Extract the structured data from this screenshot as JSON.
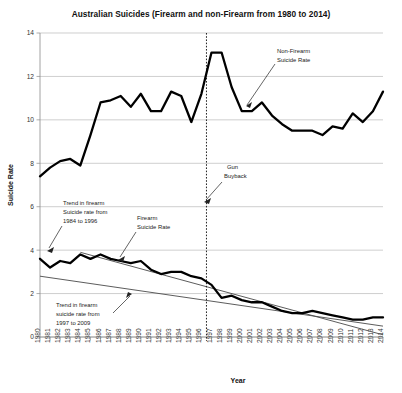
{
  "chart_data": {
    "type": "line",
    "title": "Australian Suicides (Firearm and non-Firearm from 1980 to 2014)",
    "xlabel": "Year",
    "ylabel": "Suicide Rate",
    "xlim": [
      1980,
      2014
    ],
    "ylim": [
      0,
      14
    ],
    "yticks": [
      0,
      2,
      4,
      6,
      8,
      10,
      12,
      14
    ],
    "grid": "horizontal",
    "legend_position": "inline-annotations",
    "x": [
      1980,
      1981,
      1982,
      1983,
      1984,
      1985,
      1986,
      1987,
      1988,
      1989,
      1990,
      1991,
      1992,
      1993,
      1994,
      1995,
      1996,
      1997,
      1998,
      1999,
      2000,
      2001,
      2002,
      2003,
      2004,
      2005,
      2006,
      2007,
      2008,
      2009,
      2010,
      2011,
      2012,
      2013,
      2014
    ],
    "categories": [
      "1980",
      "1981",
      "1982",
      "1983",
      "1984",
      "1985",
      "1986",
      "1987",
      "1988",
      "1989",
      "1990",
      "1991",
      "1992",
      "1993",
      "1994",
      "1995",
      "1996",
      "1997",
      "1998",
      "1999",
      "2000",
      "2001",
      "2002",
      "2003",
      "2004",
      "2005",
      "2006",
      "2007",
      "2008",
      "2009",
      "2010",
      "2011",
      "2012",
      "2013",
      "2014"
    ],
    "series": [
      {
        "name": "Non-Firearm Suicide Rate",
        "values": [
          7.4,
          7.8,
          8.1,
          8.2,
          7.9,
          9.3,
          10.8,
          10.9,
          11.1,
          10.6,
          11.2,
          10.4,
          10.4,
          11.3,
          11.1,
          9.9,
          11.2,
          13.1,
          13.1,
          11.5,
          10.4,
          10.4,
          10.8,
          10.2,
          9.8,
          9.5,
          9.5,
          9.5,
          9.3,
          9.7,
          9.6,
          10.3,
          9.9,
          10.4,
          11.3
        ]
      },
      {
        "name": "Firearm Suicide Rate",
        "values": [
          3.6,
          3.2,
          3.5,
          3.4,
          3.8,
          3.6,
          3.8,
          3.6,
          3.5,
          3.4,
          3.5,
          3.1,
          2.9,
          3.0,
          3.0,
          2.8,
          2.7,
          2.4,
          1.8,
          1.9,
          1.7,
          1.6,
          1.6,
          1.4,
          1.2,
          1.1,
          1.1,
          1.2,
          1.1,
          1.0,
          0.9,
          0.8,
          0.8,
          0.9,
          0.9
        ]
      }
    ],
    "trendlines": [
      {
        "name": "Trend in firearm Suicide rate from 1984 to 1996",
        "x_start": 1984,
        "x_end": 2014,
        "y_start": 3.9,
        "y_end": 0.1
      },
      {
        "name": "Trend in firearm suicide rate from 1997 to 2009",
        "x_start": 1980,
        "x_end": 2014,
        "y_start": 2.8,
        "y_end": 0.5
      }
    ],
    "event_marker": {
      "label": "Gun Buyback",
      "year": 1996.5
    },
    "annotations": [
      {
        "id": "non-firearm",
        "text_line1": "Non-Firearm",
        "text_line2": "Suicide Rate"
      },
      {
        "id": "gun-buyback",
        "text_line1": "Gun",
        "text_line2": "Buyback"
      },
      {
        "id": "trend-1984-1996",
        "text_line1": "Trend in firearm",
        "text_line2": "Suicide rate from",
        "text_line3": "1984 to 1996"
      },
      {
        "id": "firearm",
        "text_line1": "Firearm",
        "text_line2": "Suicide Rate"
      },
      {
        "id": "trend-1997-2009",
        "text_line1": "Trend in firearm",
        "text_line2": "suicide rate from",
        "text_line3": "1997 to 2009"
      }
    ],
    "colors": {
      "series_line": "#000000",
      "trend_line": "#4a4a4a",
      "gridline": "#b9b9b9",
      "event_line": "#222222",
      "background": "#ffffff"
    }
  }
}
